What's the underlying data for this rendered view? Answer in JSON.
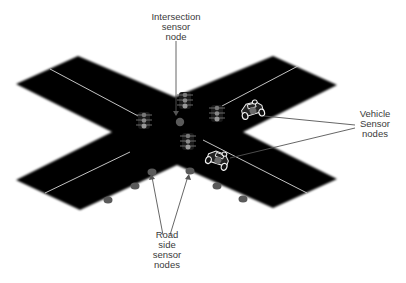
{
  "diagram": {
    "labels": {
      "intersection": [
        "Intersection",
        "sensor",
        "node"
      ],
      "vehicle": [
        "Vehicle",
        "Sensor",
        "nodes"
      ],
      "roadside": [
        "Road",
        "side",
        "sensor",
        "nodes"
      ]
    },
    "colors": {
      "road": "#000000",
      "lane_marking": "#d8d8d8",
      "sensor_node": "#5a5a5a",
      "leader_line": "#555555",
      "text": "#3a3a3a",
      "background": "#ffffff"
    },
    "traffic_lights": [
      {
        "id": "top",
        "x": 185,
        "y": 92
      },
      {
        "id": "left",
        "x": 144,
        "y": 112
      },
      {
        "id": "right",
        "x": 217,
        "y": 105
      },
      {
        "id": "bottom",
        "x": 188,
        "y": 133
      }
    ],
    "vehicles": [
      {
        "id": "vehicle-1",
        "x": 252,
        "y": 111
      },
      {
        "id": "vehicle-2",
        "x": 217,
        "y": 160
      }
    ],
    "intersection_node": {
      "x": 180,
      "y": 122
    },
    "roadside_nodes": [
      {
        "x": 152,
        "y": 172
      },
      {
        "x": 135,
        "y": 186
      },
      {
        "x": 108,
        "y": 200
      },
      {
        "x": 190,
        "y": 171
      },
      {
        "x": 217,
        "y": 186
      },
      {
        "x": 243,
        "y": 199
      }
    ]
  }
}
